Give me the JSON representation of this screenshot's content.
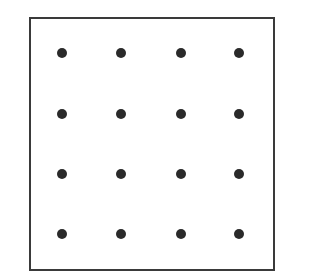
{
  "diagram": {
    "type": "dot-grid",
    "rows": 4,
    "columns": 4,
    "dot_color": "#2a2a2a",
    "border_color": "#3a3a3a",
    "dot_positions_x": [
      62,
      121,
      181,
      239
    ],
    "dot_positions_y": [
      53,
      114,
      174,
      234
    ]
  }
}
